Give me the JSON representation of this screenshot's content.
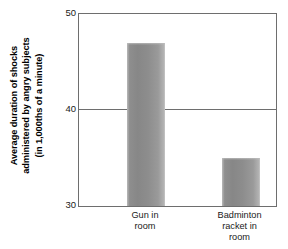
{
  "chart_data": {
    "type": "bar",
    "title": "",
    "xlabel": "",
    "ylabel_line1": "Average duration of shocks",
    "ylabel_line2": "administered by angry subjects",
    "ylabel_line3": "(in 1,000ths of a minute)",
    "categories": [
      "Gun in room",
      "Badminton racket in room"
    ],
    "category_lines": [
      [
        "Gun in",
        "room"
      ],
      [
        "Badminton",
        "racket in",
        "room"
      ]
    ],
    "values": [
      47,
      35
    ],
    "ylim": [
      30,
      50
    ],
    "yticks": [
      30,
      40,
      50
    ],
    "ytick_labels": [
      "30",
      "40",
      "50"
    ],
    "grid": "horizontal-line-at-40",
    "legend": "none",
    "bar_color": "#8e8e8e",
    "axis_color": "#6e6e6e",
    "background": "#ffffff"
  }
}
